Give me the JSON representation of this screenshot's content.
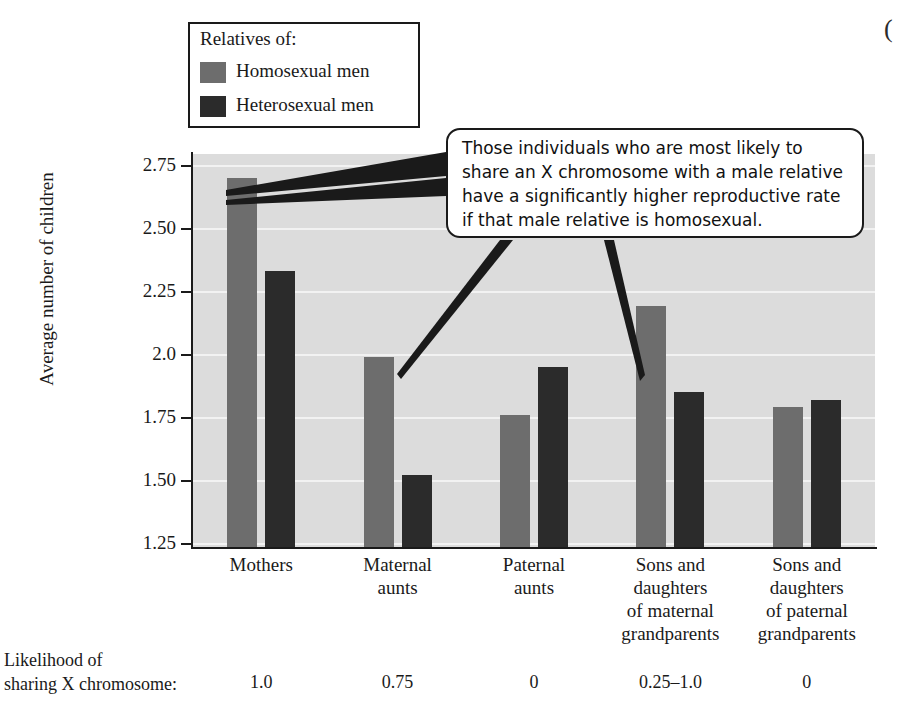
{
  "legend": {
    "title": "Relatives of:",
    "entries": [
      {
        "label": "Homosexual men",
        "color": "#6d6d6d",
        "swatch": "homosexual-swatch"
      },
      {
        "label": "Heterosexual men",
        "color": "#2b2b2b",
        "swatch": "heterosexual-swatch"
      }
    ]
  },
  "callout": {
    "line1": "Those individuals who are most likely to",
    "line2": "share an X chromosome with a male relative",
    "line3": "have a significantly higher reproductive rate",
    "line4": "if that male relative is homosexual."
  },
  "likelihood": {
    "label_line1": "Likelihood of",
    "label_line2": "sharing X chromosome:",
    "values": [
      "1.0",
      "0.75",
      "0",
      "0.25–1.0",
      "0"
    ]
  },
  "corner_artifact": "(",
  "chart_data": {
    "type": "bar",
    "title": "",
    "xlabel": "",
    "ylabel": "Average number of children",
    "ylim": [
      1.15,
      2.8
    ],
    "yticks": [
      1.25,
      1.5,
      1.75,
      2.0,
      2.25,
      2.5,
      2.75
    ],
    "ytick_labels": [
      "1.25",
      "1.50",
      "1.75",
      "2.0",
      "2.25",
      "2.50",
      "2.75"
    ],
    "grid": true,
    "legend_position": "upper-left-outside",
    "categories": [
      "Mothers",
      "Maternal aunts",
      "Paternal aunts",
      "Sons and daughters of maternal grandparents",
      "Sons and daughters of paternal grandparents"
    ],
    "category_lines": [
      [
        "Mothers"
      ],
      [
        "Maternal",
        "aunts"
      ],
      [
        "Paternal",
        "aunts"
      ],
      [
        "Sons and",
        "daughters",
        "of maternal",
        "grandparents"
      ],
      [
        "Sons and",
        "daughters",
        "of paternal",
        "grandparents"
      ]
    ],
    "series": [
      {
        "name": "Homosexual men",
        "color": "#6d6d6d",
        "values": [
          2.7,
          1.99,
          1.76,
          2.19,
          1.79
        ]
      },
      {
        "name": "Heterosexual men",
        "color": "#2b2b2b",
        "values": [
          2.33,
          1.52,
          1.95,
          1.85,
          1.82
        ]
      }
    ],
    "annotations": [
      {
        "text": "Those individuals who are most likely to share an X chromosome with a male relative have a significantly higher reproductive rate if that male relative is homosexual.",
        "points_to": [
          "Mothers / Homosexual men",
          "Maternal aunts / Homosexual men",
          "Sons and daughters of maternal grandparents / Homosexual men"
        ]
      }
    ],
    "footer_row": {
      "label": "Likelihood of sharing X chromosome:",
      "values": [
        "1.0",
        "0.75",
        "0",
        "0.25–1.0",
        "0"
      ]
    }
  }
}
